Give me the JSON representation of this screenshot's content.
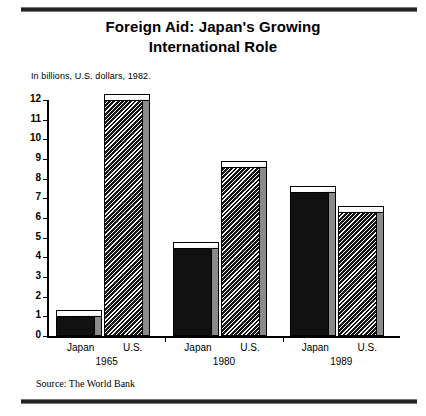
{
  "title": "Foreign Aid: Japan's Growing\nInternational Role",
  "title_line1": "Foreign Aid: Japan's Growing",
  "title_line2": "International Role",
  "subtitle": "In billions, U.S. dollars, 1982.",
  "source": "Source: The World Bank",
  "colors": {
    "ink": "#000000",
    "background": "#ffffff",
    "japan_fill": "#111111",
    "us_hatch": "#151515",
    "bar_side": "#8a8a8a"
  },
  "chart_data": {
    "type": "bar",
    "title": "Foreign Aid: Japan's Growing International Role",
    "subtitle": "In billions, U.S. dollars, 1982.",
    "source": "Source: The World Bank",
    "xlabel": "",
    "ylabel": "",
    "ylim": [
      0,
      12
    ],
    "yticks": [
      0,
      1,
      2,
      3,
      4,
      5,
      6,
      7,
      8,
      9,
      10,
      11,
      12
    ],
    "ytick_labels": [
      "0",
      "1",
      "2",
      "3",
      "4",
      "5",
      "6",
      "7",
      "8",
      "9",
      "10",
      "11",
      "12"
    ],
    "grid": false,
    "legend": "none",
    "units": "billions of 1982 U.S. dollars",
    "categories": [
      "1965",
      "1980",
      "1989"
    ],
    "series": [
      {
        "name": "Japan",
        "style": "solid",
        "values": [
          1.0,
          4.5,
          7.3
        ]
      },
      {
        "name": "U.S.",
        "style": "hatched",
        "values": [
          12.0,
          8.6,
          6.3
        ]
      }
    ],
    "groups": [
      {
        "year": "1965",
        "bars": [
          {
            "label": "Japan",
            "value": 1.0,
            "style": "solid"
          },
          {
            "label": "U.S.",
            "value": 12.0,
            "style": "hatched"
          }
        ]
      },
      {
        "year": "1980",
        "bars": [
          {
            "label": "Japan",
            "value": 4.5,
            "style": "solid"
          },
          {
            "label": "U.S.",
            "value": 8.6,
            "style": "hatched"
          }
        ]
      },
      {
        "year": "1989",
        "bars": [
          {
            "label": "Japan",
            "value": 7.3,
            "style": "solid"
          },
          {
            "label": "U.S.",
            "value": 6.3,
            "style": "hatched"
          }
        ]
      }
    ]
  }
}
